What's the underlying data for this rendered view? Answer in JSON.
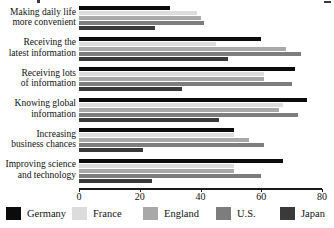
{
  "chart_data": {
    "type": "bar",
    "orientation": "horizontal",
    "title": "",
    "xlabel": "",
    "ylabel": "",
    "xlim": [
      0,
      80
    ],
    "xticks": [
      0,
      20,
      40,
      60,
      80
    ],
    "xtick_labels": [
      "0",
      "20",
      "40",
      "60",
      "80"
    ],
    "grid": false,
    "legend_position": "bottom",
    "categories": [
      "Making daily life more convenient",
      "Receiving the latest information",
      "Receiving lots of information",
      "Knowing global information",
      "Increasing business chances",
      "Improving science and technology"
    ],
    "series": [
      {
        "name": "Germany",
        "color": "#0b0b0b",
        "values": [
          30,
          60,
          71,
          75,
          51,
          67
        ]
      },
      {
        "name": "France",
        "color": "#dcdcdc",
        "values": [
          39,
          45,
          61,
          67,
          51,
          51
        ]
      },
      {
        "name": "England",
        "color": "#a8a8a8",
        "values": [
          40,
          68,
          61,
          66,
          56,
          51
        ]
      },
      {
        "name": "U.S.",
        "color": "#7d7d7d",
        "values": [
          41,
          73,
          70,
          72,
          61,
          60
        ]
      },
      {
        "name": "Japan",
        "color": "#3a3a3a",
        "values": [
          25,
          49,
          34,
          46,
          21,
          24
        ]
      }
    ]
  },
  "categories_lines": [
    [
      "Making daily life",
      "more convenient"
    ],
    [
      "Receiving the",
      "latest information"
    ],
    [
      "Receiving lots",
      "of information"
    ],
    [
      "Knowing global",
      "information"
    ],
    [
      "Increasing",
      "business chances"
    ],
    [
      "Improving science",
      "and technology"
    ]
  ],
  "axis": {
    "ticks": [
      {
        "label": "0",
        "value": 0
      },
      {
        "label": "20",
        "value": 20
      },
      {
        "label": "40",
        "value": 40
      },
      {
        "label": "60",
        "value": 60
      },
      {
        "label": "80",
        "value": 80
      }
    ]
  },
  "legend": {
    "items": [
      {
        "label": "Germany",
        "color": "#0b0b0b"
      },
      {
        "label": "France",
        "color": "#dcdcdc"
      },
      {
        "label": "England",
        "color": "#a8a8a8"
      },
      {
        "label": "U.S.",
        "color": "#7d7d7d"
      },
      {
        "label": "Japan",
        "color": "#3a3a3a"
      }
    ]
  }
}
